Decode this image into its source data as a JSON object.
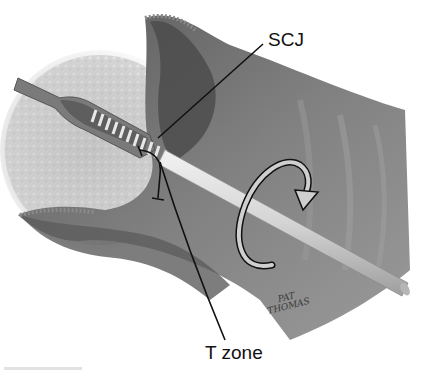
{
  "figure": {
    "labels": {
      "scj": "SCJ",
      "t_zone": "T zone"
    },
    "signature": {
      "line1": "PAT",
      "line2": "THOMAS"
    },
    "components": [
      "cervical-stroma",
      "endocervical-canal",
      "cytobrush",
      "brush-handle",
      "rotation-arrow",
      "vaginal-wall",
      "squamocolumnar-junction-pointer",
      "transformation-zone-pointer"
    ],
    "colors": {
      "background": "#ffffff",
      "stroma": "#c9c9c9",
      "vaginal_wall": "#6e6e6e",
      "handle": "#d8d8d8",
      "ink": "#111111"
    }
  }
}
